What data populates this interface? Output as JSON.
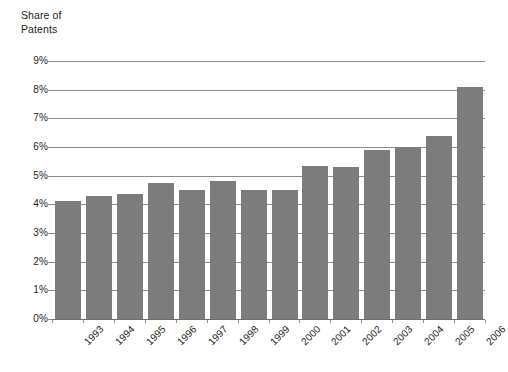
{
  "chart_data": {
    "type": "bar",
    "title_line1": "Share of",
    "title_line2": "Patents",
    "xlabel": "",
    "ylabel": "Share of Patents",
    "categories": [
      "1993",
      "1994",
      "1995",
      "1996",
      "1997",
      "1998",
      "1999",
      "2000",
      "2001",
      "2002",
      "2003",
      "2004",
      "2005",
      "2006"
    ],
    "values": [
      4.1,
      4.3,
      4.35,
      4.75,
      4.5,
      4.8,
      4.5,
      4.5,
      5.35,
      5.3,
      5.9,
      6.0,
      6.4,
      8.1
    ],
    "value_labels": [
      "4.1%",
      "4.3%",
      "4.35%",
      "4.75%",
      "4.5%",
      "4.8%",
      "4.5%",
      "4.5%",
      "5.35%",
      "5.3%",
      "5.9%",
      "6.0%",
      "6.4%",
      "8.1%"
    ],
    "ylim": [
      0,
      9
    ],
    "ytick_values": [
      0,
      1,
      2,
      3,
      4,
      5,
      6,
      7,
      8,
      9
    ],
    "ytick_labels": [
      "0%",
      "1%",
      "2%",
      "3%",
      "4%",
      "5%",
      "6%",
      "7%",
      "8%",
      "9%"
    ],
    "grid": true,
    "legend": null,
    "legend_position": "none",
    "series": [
      {
        "name": "Share of Patents",
        "values": [
          4.1,
          4.3,
          4.35,
          4.75,
          4.5,
          4.8,
          4.5,
          4.5,
          5.35,
          5.3,
          5.9,
          6.0,
          6.4,
          8.1
        ]
      }
    ],
    "colors": {
      "bar": "#7c7c7c",
      "gridline": "#8c8c8c",
      "text": "#231f20",
      "background": "#ffffff"
    }
  }
}
